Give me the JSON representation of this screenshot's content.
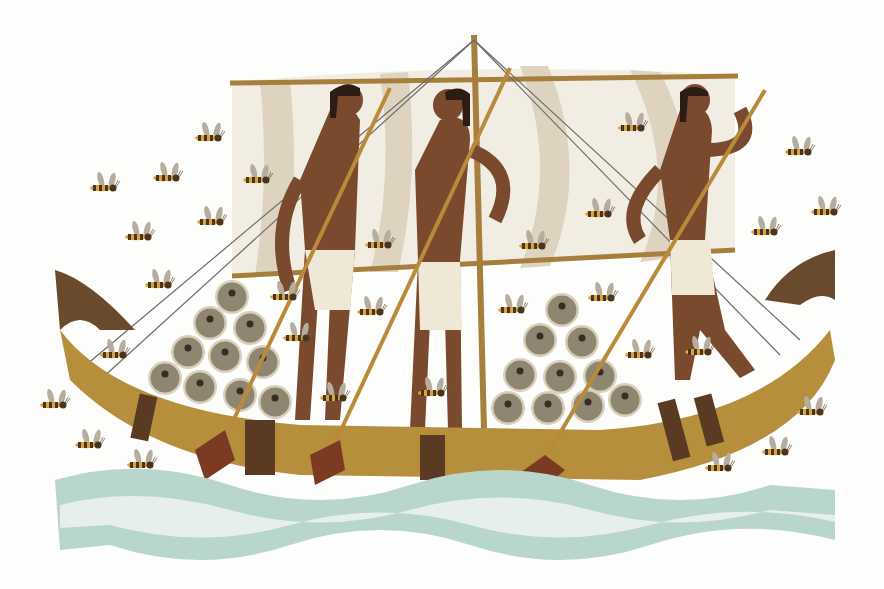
{
  "scene": {
    "subject": "Illustration of an ancient Egyptian boat with three rowers, a striped sail, stacked round cargo, and bees flying around, above stylized waves",
    "colors": {
      "background": "#fdfdfb",
      "sail_light": "#f2ede2",
      "sail_stripe": "#ddd3bf",
      "hull": "#b58f3c",
      "hull_dark": "#6a4a2c",
      "skin": "#7a4a2e",
      "hair": "#2d1c14",
      "loincloth": "#efe8d6",
      "cargo": "#8f8672",
      "cargo_rim": "#d8d0bc",
      "oar": "#b98a3a",
      "oar_blade": "#7b3b22",
      "water": "#b9d6cc",
      "water_light": "#e6efe9",
      "bee_body": "#4a3420",
      "bee_stripe": "#d7a43c",
      "bee_wing": "#b6ad9f"
    },
    "rowers": 3,
    "bees": 30
  }
}
